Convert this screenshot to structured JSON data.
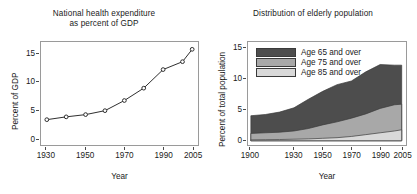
{
  "chart_data": [
    {
      "type": "line",
      "panel": "left",
      "title_lines": [
        "National health expenditure",
        "as percent of GDP"
      ],
      "xlabel": "Year",
      "ylabel": "Percent of GDP",
      "xlim": [
        1927,
        2008
      ],
      "ylim": [
        -1.0,
        17.3
      ],
      "grid": false,
      "legend": "none",
      "xticks": [
        "1930",
        "1950",
        "1970",
        "1990",
        "2005"
      ],
      "xtick_values": [
        1930,
        1950,
        1970,
        1990,
        2005
      ],
      "yticks": [
        "0",
        "5",
        "10",
        "15"
      ],
      "ytick_values": [
        0,
        5,
        10,
        15
      ],
      "marker": "open-circle",
      "x": [
        1930,
        1940,
        1950,
        1960,
        1970,
        1980,
        1990,
        2000,
        2005
      ],
      "values": [
        3.5,
        4.0,
        4.4,
        5.1,
        6.9,
        9.1,
        12.4,
        13.8,
        16.0
      ]
    },
    {
      "type": "area",
      "panel": "right",
      "title_lines": [
        "Distribution of elderly population"
      ],
      "xlabel": "Year",
      "ylabel": "Percent of total population",
      "xlim": [
        1898,
        2008
      ],
      "ylim": [
        -0.7,
        16.2
      ],
      "grid": false,
      "legend": "upper-left-inside",
      "stacking": "overlaid-cumulative",
      "xticks": [
        "1900",
        "1930",
        "1950",
        "1970",
        "1990",
        "2005"
      ],
      "xtick_values": [
        1900,
        1930,
        1950,
        1970,
        1990,
        2005
      ],
      "yticks": [
        "0",
        "5",
        "10",
        "15"
      ],
      "ytick_values": [
        0,
        5,
        10,
        15
      ],
      "x": [
        1900,
        1910,
        1920,
        1930,
        1940,
        1950,
        1960,
        1970,
        1980,
        1990,
        2000,
        2005
      ],
      "series": [
        {
          "name": "Age 65 and over",
          "color": "#4d4d4d",
          "values": [
            4.1,
            4.3,
            4.7,
            5.4,
            6.8,
            8.1,
            9.2,
            9.8,
            11.3,
            12.5,
            12.4,
            12.4
          ]
        },
        {
          "name": "Age 75 and over",
          "color": "#a8a8a8",
          "values": [
            1.2,
            1.3,
            1.4,
            1.6,
            2.0,
            2.6,
            3.1,
            3.7,
            4.4,
            5.3,
            5.9,
            6.0
          ]
        },
        {
          "name": "Age 85 and over",
          "color": "#d9d9d9",
          "values": [
            0.15,
            0.17,
            0.2,
            0.25,
            0.3,
            0.4,
            0.5,
            0.7,
            1.0,
            1.3,
            1.6,
            1.8
          ]
        }
      ]
    }
  ],
  "left_panel": {
    "title_line1": "National health expenditure",
    "title_line2": "as percent of GDP",
    "ylabel": "Percent of GDP",
    "xlabel": "Year"
  },
  "right_panel": {
    "title_line1": "Distribution of elderly population",
    "ylabel": "Percent of total population",
    "xlabel": "Year",
    "legend": [
      {
        "label": "Age 65 and over",
        "color": "#4d4d4d"
      },
      {
        "label": "Age 75 and over",
        "color": "#a8a8a8"
      },
      {
        "label": "Age 85 and over",
        "color": "#d9d9d9"
      }
    ]
  }
}
